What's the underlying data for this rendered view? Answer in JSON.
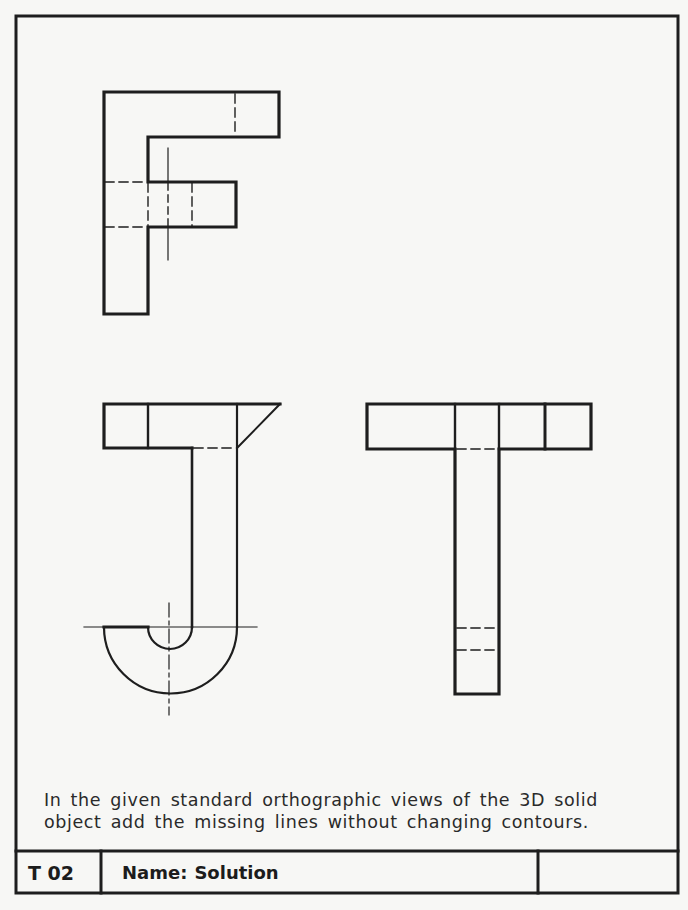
{
  "sheet": {
    "background": "#f7f7f5",
    "line_color": "#1e1e1e",
    "border": {
      "x": 16,
      "y": 16,
      "width": 662,
      "height": 877
    }
  },
  "figures": {
    "F_view": {
      "label": "F-shaped orthographic view"
    },
    "J_view": {
      "label": "J-shaped orthographic view"
    },
    "T_view": {
      "label": "T-shaped orthographic view"
    }
  },
  "instructions": {
    "line1": "In the given standard orthographic views of the 3D solid",
    "line2": "object add the missing lines without changing contours."
  },
  "title_block": {
    "code": "T 02",
    "name_label": "Name:",
    "name_value": "Solution",
    "extra_cell": ""
  }
}
